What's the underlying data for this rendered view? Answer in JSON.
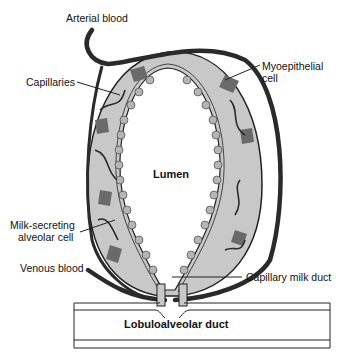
{
  "diagram": {
    "labels": {
      "arterial_blood": "Arterial blood",
      "capillaries": "Capillaries",
      "myoepithelial_line1": "Myoepithelial",
      "myoepithelial_line2": "cell",
      "lumen": "Lumen",
      "milk_secreting_line1": "Milk-secreting",
      "milk_secreting_line2": "alveolar cell",
      "venous_blood": "Venous blood",
      "capillary_milk_duct": "Capillary milk duct",
      "lobuloalveolar_duct": "Lobuloalveolar duct"
    },
    "colors": {
      "vessel": "#2a2a2a",
      "tissue": "#c8c8c8",
      "myoepithelial": "#6a6a6a",
      "outline": "#222222",
      "background": "#ffffff"
    }
  }
}
